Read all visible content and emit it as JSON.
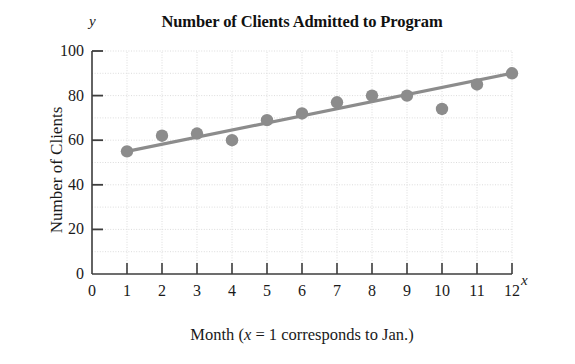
{
  "chart_data": {
    "type": "scatter",
    "title": "Number of Clients Admitted to Program",
    "xlabel_prefix": "Month (",
    "xlabel_var": "x",
    "xlabel_suffix": " = 1 corresponds to Jan.)",
    "xlabel_full": "Month (x = 1 corresponds to Jan.)",
    "ylabel": "Number of Clients",
    "x_axis_letter": "y",
    "y_axis_letter_note": "y appears above the vertical axis",
    "axis_letter_x": "x",
    "axis_letter_y": "y",
    "xlim": [
      0,
      12
    ],
    "ylim": [
      0,
      100
    ],
    "x_major_ticks": [
      0,
      1,
      2,
      3,
      4,
      5,
      6,
      7,
      8,
      9,
      10,
      11,
      12
    ],
    "x_tick_labels": [
      "0",
      "1",
      "2",
      "3",
      "4",
      "5",
      "6",
      "7",
      "8",
      "9",
      "10",
      "11",
      "12"
    ],
    "y_major_ticks": [
      0,
      20,
      40,
      60,
      80,
      100
    ],
    "y_tick_labels": [
      "0",
      "20",
      "40",
      "60",
      "80",
      "100"
    ],
    "y_minor_ticks": [
      10,
      30,
      50,
      70,
      90
    ],
    "grid": true,
    "grid_style": "dotted light gray, vertical at each month, horizontal every 10 units",
    "legend": "none",
    "series": [
      {
        "name": "Clients admitted",
        "marker": "filled circle",
        "color": "#8c8c8c",
        "x": [
          1,
          2,
          3,
          4,
          5,
          6,
          7,
          8,
          9,
          10,
          11,
          12
        ],
        "values": [
          55,
          62,
          63,
          60,
          69,
          72,
          77,
          80,
          80,
          74,
          85,
          90
        ]
      },
      {
        "name": "Trend line (best fit)",
        "type": "line",
        "color": "#8c8c8c",
        "x": [
          1,
          12
        ],
        "values": [
          55,
          90
        ]
      }
    ]
  },
  "colors": {
    "marker": "#8c8c8c",
    "line": "#8c8c8c",
    "axis": "#3d3d3d",
    "grid": "#dcdcdc",
    "text": "#1a1a1a",
    "background": "#ffffff"
  }
}
